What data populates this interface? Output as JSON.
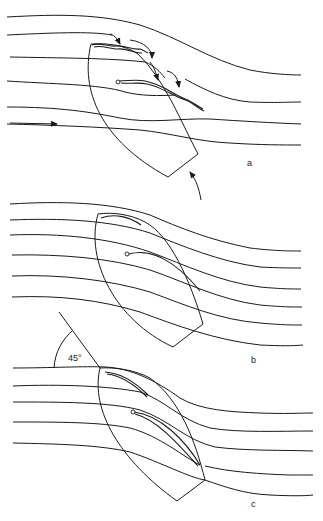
{
  "figure": {
    "panels": [
      {
        "id": "a",
        "label": "a",
        "description": "Stalled flow around sails: turbulent eddies on leeward side, boat turning head-to-wind"
      },
      {
        "id": "b",
        "label": "b",
        "description": "Attached streamlines around sails"
      },
      {
        "id": "c",
        "label": "c",
        "description": "Streamlines with apparent wind at 45 degrees to centerline"
      }
    ],
    "angle_annotation": "45°",
    "colors": {
      "line": "#1a1a1a",
      "background": "#ffffff"
    }
  }
}
